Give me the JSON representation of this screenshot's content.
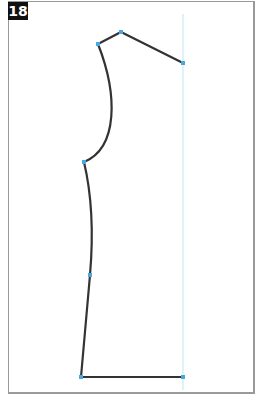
{
  "figure": {
    "label": "18",
    "colors": {
      "outline": "#333333",
      "point": "#4aa8e0",
      "guide": "#bfe6f2",
      "frame": "#9a9a9a"
    },
    "points": [
      {
        "name": "neck-front",
        "x": 98,
        "y": 44
      },
      {
        "name": "neck-top",
        "x": 121,
        "y": 32
      },
      {
        "name": "shoulder",
        "x": 183,
        "y": 63
      },
      {
        "name": "armhole-bottom",
        "x": 84,
        "y": 162
      },
      {
        "name": "side-waist",
        "x": 90,
        "y": 275
      },
      {
        "name": "hem-side",
        "x": 81,
        "y": 377
      },
      {
        "name": "hem-center",
        "x": 183,
        "y": 377
      }
    ]
  }
}
